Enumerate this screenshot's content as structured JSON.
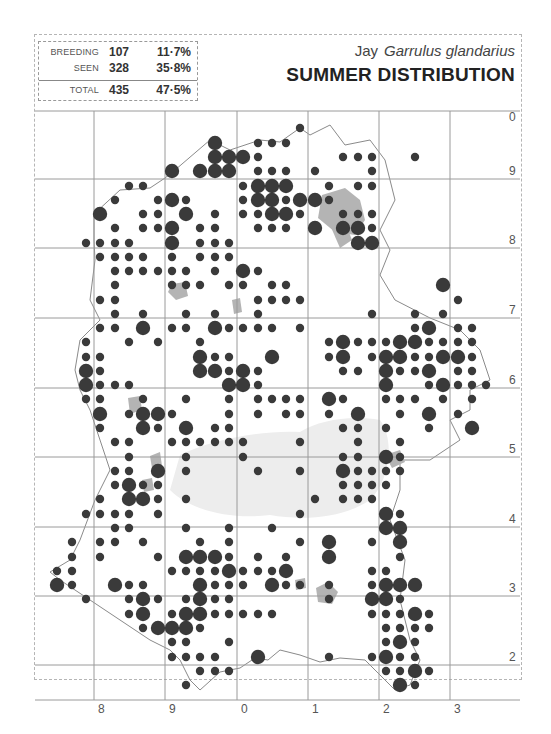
{
  "header": {
    "species_common": "Jay",
    "species_latin": "Garrulus glandarius",
    "title": "SUMMER DISTRIBUTION"
  },
  "stats": {
    "breeding": {
      "label": "BREEDING",
      "count": "107",
      "percent": "11·7%"
    },
    "seen": {
      "label": "SEEN",
      "count": "328",
      "percent": "35·8%"
    },
    "total": {
      "label": "TOTAL",
      "count": "435",
      "percent": "47·5%"
    }
  },
  "grid": {
    "x_labels": [
      "8",
      "9",
      "0",
      "1",
      "2",
      "3"
    ],
    "y_labels": [
      "0",
      "9",
      "8",
      "7",
      "6",
      "5",
      "4",
      "3",
      "2"
    ],
    "x_lines": [
      94,
      165,
      237,
      308,
      379,
      450
    ],
    "y_lines": [
      111,
      179,
      248,
      318,
      388,
      457,
      527,
      596,
      665
    ]
  },
  "legend": {
    "large_dot": "breeding",
    "small_dot": "seen"
  },
  "colors": {
    "dot": "#3a3a3a",
    "urban": "#b4b4b4",
    "forest": "#ededed",
    "boundary": "#8a8a8a",
    "grid": "#9a9a9a",
    "header_band": "#efefef"
  },
  "dots": [
    [
      215,
      143,
      "b"
    ],
    [
      215,
      157,
      "b"
    ],
    [
      229,
      157,
      "b"
    ],
    [
      243,
      157,
      "b"
    ],
    [
      200,
      171,
      "b"
    ],
    [
      215,
      171,
      "b"
    ],
    [
      229,
      171,
      "b"
    ],
    [
      172,
      171,
      "b"
    ],
    [
      258,
      143,
      "s"
    ],
    [
      272,
      143,
      "s"
    ],
    [
      286,
      143,
      "s"
    ],
    [
      300,
      128,
      "s"
    ],
    [
      258,
      157,
      "s"
    ],
    [
      258,
      171,
      "s"
    ],
    [
      272,
      171,
      "s"
    ],
    [
      286,
      171,
      "s"
    ],
    [
      343,
      157,
      "s"
    ],
    [
      358,
      157,
      "s"
    ],
    [
      372,
      157,
      "s"
    ],
    [
      415,
      157,
      "s"
    ],
    [
      372,
      171,
      "s"
    ],
    [
      315,
      171,
      "s"
    ],
    [
      258,
      186,
      "b"
    ],
    [
      272,
      186,
      "b"
    ],
    [
      286,
      186,
      "b"
    ],
    [
      258,
      200,
      "b"
    ],
    [
      272,
      200,
      "b"
    ],
    [
      300,
      200,
      "b"
    ],
    [
      315,
      200,
      "b"
    ],
    [
      272,
      214,
      "b"
    ],
    [
      286,
      214,
      "b"
    ],
    [
      243,
      186,
      "s"
    ],
    [
      243,
      200,
      "s"
    ],
    [
      286,
      200,
      "s"
    ],
    [
      243,
      214,
      "s"
    ],
    [
      258,
      214,
      "s"
    ],
    [
      300,
      214,
      "s"
    ],
    [
      258,
      228,
      "s"
    ],
    [
      272,
      228,
      "s"
    ],
    [
      286,
      228,
      "s"
    ],
    [
      329,
      186,
      "s"
    ],
    [
      358,
      186,
      "s"
    ],
    [
      372,
      186,
      "s"
    ],
    [
      329,
      200,
      "s"
    ],
    [
      343,
      214,
      "s"
    ],
    [
      358,
      214,
      "s"
    ],
    [
      372,
      214,
      "s"
    ],
    [
      315,
      228,
      "b"
    ],
    [
      343,
      228,
      "b"
    ],
    [
      358,
      228,
      "b"
    ],
    [
      358,
      243,
      "b"
    ],
    [
      372,
      243,
      "b"
    ],
    [
      372,
      228,
      "s"
    ],
    [
      100,
      214,
      "b"
    ],
    [
      172,
      200,
      "b"
    ],
    [
      186,
      214,
      "b"
    ],
    [
      172,
      228,
      "b"
    ],
    [
      172,
      243,
      "b"
    ],
    [
      215,
      214,
      "s"
    ],
    [
      129,
      186,
      "s"
    ],
    [
      143,
      186,
      "s"
    ],
    [
      158,
      200,
      "s"
    ],
    [
      186,
      200,
      "s"
    ],
    [
      143,
      214,
      "s"
    ],
    [
      158,
      214,
      "s"
    ],
    [
      115,
      200,
      "s"
    ],
    [
      115,
      228,
      "s"
    ],
    [
      143,
      228,
      "s"
    ],
    [
      158,
      228,
      "s"
    ],
    [
      200,
      228,
      "s"
    ],
    [
      215,
      228,
      "s"
    ],
    [
      86,
      243,
      "s"
    ],
    [
      100,
      243,
      "s"
    ],
    [
      115,
      243,
      "s"
    ],
    [
      129,
      243,
      "s"
    ],
    [
      200,
      243,
      "s"
    ],
    [
      215,
      243,
      "s"
    ],
    [
      229,
      243,
      "s"
    ],
    [
      100,
      257,
      "s"
    ],
    [
      115,
      257,
      "s"
    ],
    [
      129,
      257,
      "s"
    ],
    [
      143,
      257,
      "s"
    ],
    [
      172,
      257,
      "s"
    ],
    [
      200,
      257,
      "s"
    ],
    [
      215,
      257,
      "s"
    ],
    [
      229,
      257,
      "s"
    ],
    [
      115,
      271,
      "s"
    ],
    [
      129,
      271,
      "s"
    ],
    [
      143,
      271,
      "s"
    ],
    [
      158,
      271,
      "s"
    ],
    [
      172,
      271,
      "s"
    ],
    [
      186,
      271,
      "s"
    ],
    [
      215,
      271,
      "s"
    ],
    [
      243,
      271,
      "b"
    ],
    [
      258,
      271,
      "s"
    ],
    [
      115,
      285,
      "s"
    ],
    [
      172,
      285,
      "s"
    ],
    [
      186,
      285,
      "s"
    ],
    [
      200,
      285,
      "s"
    ],
    [
      229,
      285,
      "s"
    ],
    [
      243,
      285,
      "s"
    ],
    [
      272,
      285,
      "s"
    ],
    [
      286,
      285,
      "s"
    ],
    [
      100,
      300,
      "s"
    ],
    [
      115,
      300,
      "s"
    ],
    [
      258,
      300,
      "s"
    ],
    [
      272,
      300,
      "s"
    ],
    [
      286,
      300,
      "s"
    ],
    [
      300,
      300,
      "s"
    ],
    [
      115,
      314,
      "s"
    ],
    [
      143,
      314,
      "s"
    ],
    [
      186,
      314,
      "s"
    ],
    [
      215,
      314,
      "s"
    ],
    [
      258,
      314,
      "s"
    ],
    [
      443,
      285,
      "b"
    ],
    [
      458,
      300,
      "s"
    ],
    [
      100,
      328,
      "s"
    ],
    [
      115,
      328,
      "s"
    ],
    [
      143,
      328,
      "b"
    ],
    [
      172,
      328,
      "s"
    ],
    [
      186,
      328,
      "s"
    ],
    [
      215,
      328,
      "b"
    ],
    [
      229,
      328,
      "s"
    ],
    [
      243,
      328,
      "s"
    ],
    [
      258,
      328,
      "s"
    ],
    [
      272,
      328,
      "s"
    ],
    [
      86,
      342,
      "s"
    ],
    [
      129,
      342,
      "s"
    ],
    [
      158,
      342,
      "s"
    ],
    [
      200,
      342,
      "s"
    ],
    [
      300,
      328,
      "s"
    ],
    [
      372,
      314,
      "s"
    ],
    [
      415,
      314,
      "s"
    ],
    [
      443,
      314,
      "s"
    ],
    [
      415,
      328,
      "s"
    ],
    [
      429,
      328,
      "b"
    ],
    [
      458,
      328,
      "s"
    ],
    [
      472,
      328,
      "s"
    ],
    [
      86,
      357,
      "s"
    ],
    [
      100,
      357,
      "s"
    ],
    [
      200,
      357,
      "b"
    ],
    [
      215,
      357,
      "s"
    ],
    [
      229,
      357,
      "s"
    ],
    [
      272,
      357,
      "b"
    ],
    [
      329,
      342,
      "s"
    ],
    [
      343,
      342,
      "b"
    ],
    [
      358,
      342,
      "s"
    ],
    [
      372,
      342,
      "s"
    ],
    [
      386,
      342,
      "s"
    ],
    [
      400,
      342,
      "b"
    ],
    [
      415,
      342,
      "b"
    ],
    [
      429,
      342,
      "s"
    ],
    [
      443,
      342,
      "s"
    ],
    [
      458,
      342,
      "s"
    ],
    [
      472,
      342,
      "s"
    ],
    [
      86,
      371,
      "b"
    ],
    [
      100,
      371,
      "s"
    ],
    [
      200,
      371,
      "b"
    ],
    [
      215,
      371,
      "b"
    ],
    [
      229,
      371,
      "s"
    ],
    [
      243,
      371,
      "b"
    ],
    [
      258,
      371,
      "s"
    ],
    [
      329,
      357,
      "s"
    ],
    [
      343,
      357,
      "b"
    ],
    [
      372,
      357,
      "s"
    ],
    [
      386,
      357,
      "b"
    ],
    [
      400,
      357,
      "b"
    ],
    [
      415,
      357,
      "s"
    ],
    [
      429,
      357,
      "s"
    ],
    [
      443,
      357,
      "b"
    ],
    [
      458,
      357,
      "b"
    ],
    [
      472,
      357,
      "s"
    ],
    [
      86,
      385,
      "b"
    ],
    [
      100,
      385,
      "s"
    ],
    [
      115,
      385,
      "s"
    ],
    [
      129,
      385,
      "s"
    ],
    [
      229,
      385,
      "b"
    ],
    [
      243,
      385,
      "b"
    ],
    [
      258,
      385,
      "s"
    ],
    [
      343,
      371,
      "s"
    ],
    [
      358,
      371,
      "s"
    ],
    [
      386,
      371,
      "b"
    ],
    [
      400,
      371,
      "s"
    ],
    [
      415,
      371,
      "s"
    ],
    [
      429,
      371,
      "b"
    ],
    [
      458,
      371,
      "s"
    ],
    [
      472,
      371,
      "s"
    ],
    [
      386,
      385,
      "b"
    ],
    [
      429,
      385,
      "s"
    ],
    [
      443,
      385,
      "b"
    ],
    [
      458,
      385,
      "s"
    ],
    [
      472,
      385,
      "s"
    ],
    [
      486,
      385,
      "s"
    ],
    [
      86,
      399,
      "s"
    ],
    [
      100,
      399,
      "s"
    ],
    [
      143,
      399,
      "s"
    ],
    [
      186,
      399,
      "s"
    ],
    [
      229,
      399,
      "s"
    ],
    [
      258,
      399,
      "s"
    ],
    [
      272,
      399,
      "s"
    ],
    [
      286,
      399,
      "s"
    ],
    [
      300,
      399,
      "s"
    ],
    [
      329,
      399,
      "b"
    ],
    [
      343,
      399,
      "s"
    ],
    [
      386,
      399,
      "s"
    ],
    [
      400,
      399,
      "s"
    ],
    [
      415,
      399,
      "s"
    ],
    [
      443,
      399,
      "s"
    ],
    [
      472,
      399,
      "s"
    ],
    [
      100,
      414,
      "b"
    ],
    [
      129,
      414,
      "s"
    ],
    [
      143,
      414,
      "b"
    ],
    [
      158,
      414,
      "b"
    ],
    [
      172,
      414,
      "s"
    ],
    [
      229,
      414,
      "s"
    ],
    [
      258,
      414,
      "s"
    ],
    [
      286,
      414,
      "s"
    ],
    [
      300,
      414,
      "s"
    ],
    [
      329,
      414,
      "s"
    ],
    [
      358,
      414,
      "b"
    ],
    [
      400,
      414,
      "s"
    ],
    [
      429,
      414,
      "b"
    ],
    [
      458,
      414,
      "s"
    ],
    [
      100,
      428,
      "s"
    ],
    [
      143,
      428,
      "b"
    ],
    [
      158,
      428,
      "s"
    ],
    [
      186,
      428,
      "b"
    ],
    [
      215,
      428,
      "s"
    ],
    [
      229,
      428,
      "s"
    ],
    [
      343,
      428,
      "s"
    ],
    [
      358,
      428,
      "s"
    ],
    [
      386,
      428,
      "s"
    ],
    [
      429,
      428,
      "s"
    ],
    [
      472,
      428,
      "b"
    ],
    [
      115,
      442,
      "s"
    ],
    [
      129,
      442,
      "s"
    ],
    [
      172,
      442,
      "s"
    ],
    [
      186,
      442,
      "s"
    ],
    [
      200,
      442,
      "s"
    ],
    [
      215,
      442,
      "s"
    ],
    [
      229,
      442,
      "s"
    ],
    [
      243,
      442,
      "s"
    ],
    [
      300,
      442,
      "s"
    ],
    [
      358,
      442,
      "s"
    ],
    [
      400,
      442,
      "s"
    ],
    [
      129,
      457,
      "s"
    ],
    [
      186,
      457,
      "s"
    ],
    [
      243,
      457,
      "s"
    ],
    [
      343,
      457,
      "s"
    ],
    [
      358,
      457,
      "s"
    ],
    [
      386,
      457,
      "b"
    ],
    [
      400,
      457,
      "s"
    ],
    [
      115,
      471,
      "s"
    ],
    [
      129,
      471,
      "s"
    ],
    [
      158,
      471,
      "b"
    ],
    [
      186,
      471,
      "s"
    ],
    [
      258,
      471,
      "s"
    ],
    [
      300,
      471,
      "s"
    ],
    [
      343,
      471,
      "b"
    ],
    [
      358,
      471,
      "s"
    ],
    [
      372,
      471,
      "s"
    ],
    [
      386,
      471,
      "s"
    ],
    [
      400,
      471,
      "s"
    ],
    [
      115,
      485,
      "s"
    ],
    [
      129,
      485,
      "b"
    ],
    [
      143,
      485,
      "s"
    ],
    [
      158,
      485,
      "s"
    ],
    [
      343,
      485,
      "s"
    ],
    [
      358,
      485,
      "s"
    ],
    [
      372,
      485,
      "s"
    ],
    [
      386,
      485,
      "s"
    ],
    [
      100,
      499,
      "s"
    ],
    [
      129,
      499,
      "b"
    ],
    [
      143,
      499,
      "b"
    ],
    [
      158,
      499,
      "s"
    ],
    [
      186,
      499,
      "s"
    ],
    [
      315,
      499,
      "s"
    ],
    [
      343,
      499,
      "s"
    ],
    [
      358,
      499,
      "s"
    ],
    [
      372,
      499,
      "s"
    ],
    [
      86,
      514,
      "s"
    ],
    [
      100,
      514,
      "s"
    ],
    [
      115,
      514,
      "s"
    ],
    [
      129,
      514,
      "s"
    ],
    [
      158,
      514,
      "s"
    ],
    [
      300,
      514,
      "s"
    ],
    [
      386,
      514,
      "b"
    ],
    [
      400,
      514,
      "s"
    ],
    [
      115,
      528,
      "s"
    ],
    [
      129,
      528,
      "s"
    ],
    [
      186,
      528,
      "s"
    ],
    [
      229,
      528,
      "s"
    ],
    [
      272,
      528,
      "s"
    ],
    [
      386,
      528,
      "b"
    ],
    [
      400,
      528,
      "b"
    ],
    [
      72,
      542,
      "s"
    ],
    [
      100,
      542,
      "s"
    ],
    [
      115,
      542,
      "s"
    ],
    [
      143,
      542,
      "s"
    ],
    [
      200,
      542,
      "s"
    ],
    [
      229,
      542,
      "s"
    ],
    [
      300,
      542,
      "s"
    ],
    [
      329,
      542,
      "b"
    ],
    [
      372,
      542,
      "s"
    ],
    [
      400,
      542,
      "b"
    ],
    [
      72,
      557,
      "s"
    ],
    [
      100,
      557,
      "s"
    ],
    [
      158,
      557,
      "s"
    ],
    [
      186,
      557,
      "b"
    ],
    [
      200,
      557,
      "b"
    ],
    [
      215,
      557,
      "b"
    ],
    [
      229,
      557,
      "s"
    ],
    [
      258,
      557,
      "s"
    ],
    [
      286,
      557,
      "s"
    ],
    [
      329,
      557,
      "b"
    ],
    [
      400,
      557,
      "s"
    ],
    [
      57,
      571,
      "s"
    ],
    [
      72,
      571,
      "s"
    ],
    [
      172,
      571,
      "s"
    ],
    [
      186,
      571,
      "s"
    ],
    [
      200,
      571,
      "s"
    ],
    [
      215,
      571,
      "s"
    ],
    [
      229,
      571,
      "b"
    ],
    [
      243,
      571,
      "s"
    ],
    [
      258,
      571,
      "s"
    ],
    [
      272,
      571,
      "s"
    ],
    [
      286,
      571,
      "b"
    ],
    [
      372,
      571,
      "s"
    ],
    [
      386,
      571,
      "s"
    ],
    [
      57,
      585,
      "b"
    ],
    [
      72,
      585,
      "s"
    ],
    [
      115,
      585,
      "b"
    ],
    [
      129,
      585,
      "s"
    ],
    [
      143,
      585,
      "s"
    ],
    [
      200,
      585,
      "b"
    ],
    [
      215,
      585,
      "s"
    ],
    [
      229,
      585,
      "s"
    ],
    [
      243,
      585,
      "s"
    ],
    [
      272,
      585,
      "b"
    ],
    [
      286,
      585,
      "s"
    ],
    [
      300,
      585,
      "s"
    ],
    [
      329,
      585,
      "s"
    ],
    [
      372,
      585,
      "s"
    ],
    [
      386,
      585,
      "b"
    ],
    [
      400,
      585,
      "b"
    ],
    [
      415,
      585,
      "b"
    ],
    [
      86,
      599,
      "s"
    ],
    [
      129,
      599,
      "s"
    ],
    [
      143,
      599,
      "b"
    ],
    [
      158,
      599,
      "s"
    ],
    [
      186,
      599,
      "s"
    ],
    [
      200,
      599,
      "b"
    ],
    [
      215,
      599,
      "s"
    ],
    [
      229,
      599,
      "s"
    ],
    [
      329,
      599,
      "s"
    ],
    [
      372,
      599,
      "b"
    ],
    [
      386,
      599,
      "b"
    ],
    [
      400,
      599,
      "s"
    ],
    [
      129,
      614,
      "s"
    ],
    [
      143,
      614,
      "b"
    ],
    [
      172,
      614,
      "s"
    ],
    [
      186,
      614,
      "b"
    ],
    [
      200,
      614,
      "b"
    ],
    [
      215,
      614,
      "s"
    ],
    [
      229,
      614,
      "s"
    ],
    [
      243,
      614,
      "s"
    ],
    [
      258,
      614,
      "s"
    ],
    [
      272,
      614,
      "s"
    ],
    [
      372,
      614,
      "s"
    ],
    [
      386,
      614,
      "s"
    ],
    [
      400,
      614,
      "s"
    ],
    [
      415,
      614,
      "b"
    ],
    [
      429,
      614,
      "s"
    ],
    [
      143,
      628,
      "s"
    ],
    [
      158,
      628,
      "b"
    ],
    [
      172,
      628,
      "b"
    ],
    [
      186,
      628,
      "b"
    ],
    [
      200,
      628,
      "s"
    ],
    [
      386,
      628,
      "s"
    ],
    [
      400,
      628,
      "s"
    ],
    [
      415,
      628,
      "s"
    ],
    [
      429,
      628,
      "s"
    ],
    [
      172,
      642,
      "s"
    ],
    [
      186,
      642,
      "s"
    ],
    [
      229,
      642,
      "s"
    ],
    [
      386,
      642,
      "s"
    ],
    [
      400,
      642,
      "b"
    ],
    [
      415,
      642,
      "s"
    ],
    [
      172,
      657,
      "s"
    ],
    [
      186,
      657,
      "s"
    ],
    [
      200,
      657,
      "s"
    ],
    [
      215,
      657,
      "s"
    ],
    [
      258,
      657,
      "b"
    ],
    [
      329,
      657,
      "s"
    ],
    [
      372,
      657,
      "s"
    ],
    [
      386,
      657,
      "b"
    ],
    [
      400,
      657,
      "s"
    ],
    [
      415,
      657,
      "s"
    ],
    [
      200,
      671,
      "s"
    ],
    [
      215,
      671,
      "s"
    ],
    [
      229,
      671,
      "s"
    ],
    [
      386,
      671,
      "s"
    ],
    [
      400,
      671,
      "s"
    ],
    [
      415,
      671,
      "b"
    ],
    [
      429,
      671,
      "s"
    ],
    [
      186,
      685,
      "s"
    ],
    [
      400,
      685,
      "b"
    ],
    [
      415,
      685,
      "s"
    ]
  ]
}
